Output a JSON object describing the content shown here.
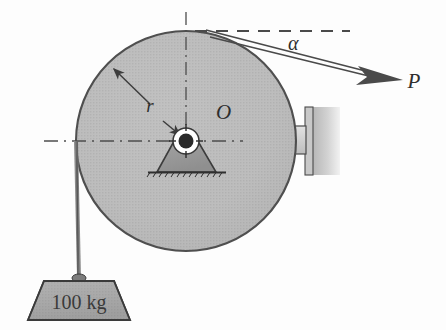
{
  "figure": {
    "background_color": "#fdfdfd"
  },
  "labels": {
    "radius": "r",
    "center": "O",
    "angle": "α",
    "force": "P",
    "mass": "100 kg"
  },
  "colors": {
    "wheel_fill": "#b9b9b9",
    "wheel_stroke": "#4a4a4a",
    "hub_dark": "#2a2a2a",
    "hub_light": "#ffffff",
    "pedestal_fill": "#9a9a9a",
    "pedestal_stroke": "#3c3c3c",
    "weight_fill": "#9e9e9e",
    "weight_stroke": "#3a3a3a",
    "wall_fill": "#cfcfcf",
    "pad_fill": "#d2d2d2",
    "line_color": "#3d3d3d",
    "dash_color": "#4d4d4d",
    "cord_color": "#6a6a6a"
  },
  "geometry": {
    "wheel_center_x": 186,
    "wheel_center_y": 141,
    "wheel_radius": 110,
    "hub_radius": 13,
    "force_angle_label": "α",
    "cord_attach_x": 76,
    "cord_attach_y": 141,
    "weight_top_y": 277
  },
  "parts": {
    "wheel": "wheel-disc",
    "hub": "hub-bearing",
    "pedestal": "support-pedestal",
    "ground": "ground-hatch",
    "brake_pad": "brake-pad",
    "wall": "wall-block",
    "cord": "hanging-cord",
    "weight": "hanging-weight",
    "force_arrow": "force-arrow-p",
    "radius_arrow": "radius-arrow",
    "vertical_centerline": "vertical-centerline",
    "horizontal_centerline": "horizontal-centerline",
    "tangent_reference": "tangent-reference-line"
  }
}
